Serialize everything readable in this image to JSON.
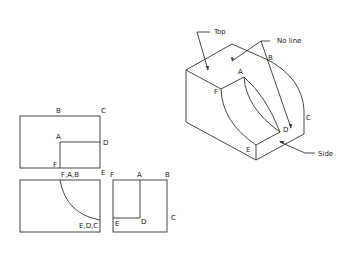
{
  "isometric_view": {
    "labels": {
      "top": "Top",
      "no_line": "No line",
      "side": "Side",
      "A": "A",
      "B": "B",
      "C": "C",
      "D": "D",
      "E": "E",
      "F": "F"
    }
  },
  "front_view": {
    "labels": {
      "B": "B",
      "C": "C",
      "A": "A",
      "D": "D",
      "F": "F",
      "E": "E"
    }
  },
  "top_view": {
    "labels": {
      "FAB": "F,A,B",
      "EDC": "E,D,C"
    }
  },
  "side_view": {
    "labels": {
      "F": "F",
      "A": "A",
      "B": "B",
      "C": "C",
      "E": "E",
      "D": "D"
    }
  }
}
